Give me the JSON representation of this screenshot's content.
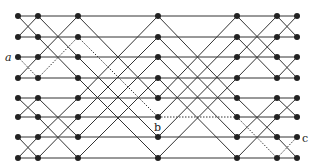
{
  "diagram": {
    "type": "butterfly-network",
    "columns_x": [
      18,
      38,
      78,
      158,
      237,
      277,
      297
    ],
    "rows_y": [
      16,
      37,
      57,
      78,
      98,
      117,
      137,
      158
    ],
    "stage_strides": [
      1,
      2,
      4,
      4,
      2,
      1
    ],
    "highlighted_path": [
      [
        0,
        2
      ],
      [
        1,
        3
      ],
      [
        2,
        1
      ],
      [
        3,
        5
      ],
      [
        4,
        5
      ],
      [
        5,
        7
      ],
      [
        6,
        6
      ]
    ],
    "labels": {
      "a": {
        "text": "a",
        "x": 5,
        "y": 61,
        "italic": true
      },
      "b": {
        "text": "b",
        "x": 154,
        "y": 131,
        "italic": false
      },
      "c": {
        "text": "c",
        "x": 302,
        "y": 142,
        "italic": false
      }
    }
  }
}
